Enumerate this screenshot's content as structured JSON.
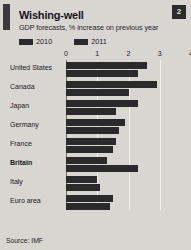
{
  "card": {
    "badge_number": "2",
    "title": "Wishing-well",
    "subtitle": "GDP forecasts, % increase on previous year",
    "source": "Source: IMF",
    "accent_color": "#3a3a3a",
    "bar_color": "#2a2a2c",
    "background_color": "#d8d6d1"
  },
  "chart_data": {
    "type": "bar",
    "title": "Wishing-well",
    "subtitle": "GDP forecasts, % increase on previous year",
    "orientation": "horizontal",
    "xlabel": "",
    "ylabel": "",
    "xlim": [
      0,
      4
    ],
    "ticks": [
      0,
      1,
      2,
      3,
      4
    ],
    "tick_labels": [
      "0",
      "1",
      "2",
      "3",
      "4"
    ],
    "grid": true,
    "legend_position": "top-left",
    "highlight_category": "Britain",
    "categories": [
      "United States",
      "Canada",
      "Japan",
      "Germany",
      "France",
      "Britain",
      "Italy",
      "Euro area"
    ],
    "series": [
      {
        "name": "2010",
        "color": "#2a2a2c",
        "values": [
          2.6,
          2.9,
          2.3,
          1.9,
          1.6,
          1.3,
          1.0,
          1.5
        ]
      },
      {
        "name": "2011",
        "color": "#2a2a2c",
        "values": [
          2.3,
          2.0,
          1.6,
          1.7,
          1.5,
          2.3,
          1.1,
          1.4
        ]
      }
    ],
    "source": "Source: IMF"
  }
}
